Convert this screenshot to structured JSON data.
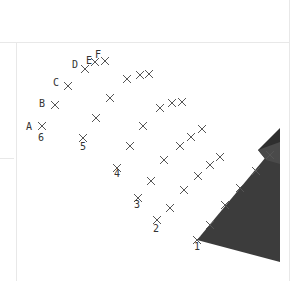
{
  "diagram": {
    "type": "3d-grid-points",
    "column_labels": [
      "A",
      "B",
      "C",
      "D",
      "E",
      "F"
    ],
    "row_labels": [
      "1",
      "2",
      "3",
      "4",
      "5",
      "6"
    ],
    "colors": {
      "background": "#ffffff",
      "frame": "#e6e6e6",
      "marker": "#555555",
      "label": "#333333",
      "surface": "#3c3c3c",
      "box_top": "#2e2e2e",
      "box_side": "#555555"
    },
    "grid_points": [
      {
        "row": "6",
        "points": [
          [
            42,
            126
          ],
          [
            55,
            105
          ],
          [
            68,
            86
          ],
          [
            85,
            69
          ],
          [
            95,
            62
          ],
          [
            105,
            61
          ]
        ]
      },
      {
        "row": "5",
        "points": [
          [
            83,
            138
          ],
          [
            96,
            118
          ],
          [
            110,
            98
          ],
          [
            127,
            79
          ],
          [
            140,
            75
          ],
          [
            149,
            74
          ]
        ]
      },
      {
        "row": "4",
        "points": [
          [
            117,
            168
          ],
          [
            130,
            146
          ],
          [
            143,
            126
          ],
          [
            160,
            108
          ],
          [
            172,
            103
          ],
          [
            182,
            102
          ]
        ]
      },
      {
        "row": "3",
        "points": [
          [
            138,
            198
          ],
          [
            151,
            181
          ],
          [
            164,
            160
          ],
          [
            180,
            146
          ],
          [
            191,
            137
          ],
          [
            202,
            129
          ]
        ]
      },
      {
        "row": "2",
        "points": [
          [
            157,
            220
          ],
          [
            170,
            208
          ],
          [
            184,
            190
          ],
          [
            198,
            176
          ],
          [
            210,
            165
          ],
          [
            220,
            157
          ]
        ]
      },
      {
        "row": "1",
        "points": [
          [
            197,
            240
          ],
          [
            210,
            225
          ],
          [
            225,
            205
          ],
          [
            240,
            188
          ],
          [
            256,
            171
          ],
          [
            270,
            155
          ]
        ]
      }
    ],
    "column_label_positions": [
      {
        "label": "A",
        "x": 26,
        "y": 130
      },
      {
        "label": "B",
        "x": 39,
        "y": 107
      },
      {
        "label": "C",
        "x": 53,
        "y": 86
      },
      {
        "label": "D",
        "x": 72,
        "y": 68
      },
      {
        "label": "E",
        "x": 86,
        "y": 64
      },
      {
        "label": "F",
        "x": 95,
        "y": 58
      }
    ],
    "row_label_positions": [
      {
        "label": "6",
        "x": 38,
        "y": 141
      },
      {
        "label": "5",
        "x": 80,
        "y": 150
      },
      {
        "label": "4",
        "x": 114,
        "y": 177
      },
      {
        "label": "3",
        "x": 134,
        "y": 208
      },
      {
        "label": "2",
        "x": 153,
        "y": 232
      },
      {
        "label": "1",
        "x": 194,
        "y": 250
      }
    ]
  }
}
